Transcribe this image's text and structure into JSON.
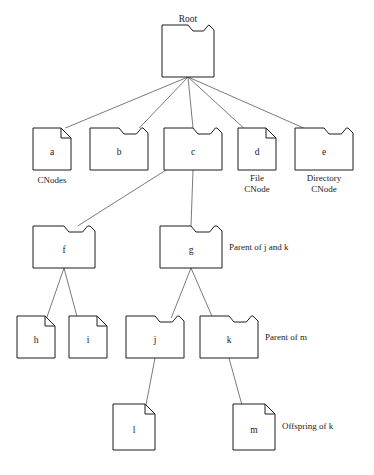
{
  "diagram": {
    "partial_top_text": "",
    "background_color": "#ffffff",
    "node_stroke_color": "#1c1c1c",
    "edge_stroke_color": "#6b6b6b",
    "text_color": "#1a1a1a"
  },
  "root": {
    "label": "Root",
    "type": "directory"
  },
  "nodes": [
    {
      "id": "root",
      "label": "Root",
      "type": "directory",
      "x": 162,
      "y": 25,
      "w": 52,
      "h": 52
    },
    {
      "id": "a",
      "label": "a",
      "type": "file",
      "x": 33,
      "y": 128,
      "w": 38,
      "h": 42
    },
    {
      "id": "b",
      "label": "b",
      "type": "directory",
      "x": 90,
      "y": 128,
      "w": 58,
      "h": 42
    },
    {
      "id": "c",
      "label": "c",
      "type": "directory",
      "x": 164,
      "y": 128,
      "w": 58,
      "h": 42
    },
    {
      "id": "d",
      "label": "d",
      "type": "file",
      "x": 238,
      "y": 128,
      "w": 38,
      "h": 42
    },
    {
      "id": "e",
      "label": "e",
      "type": "directory",
      "x": 295,
      "y": 128,
      "w": 58,
      "h": 42
    },
    {
      "id": "f",
      "label": "f",
      "type": "directory",
      "x": 33,
      "y": 226,
      "w": 62,
      "h": 42
    },
    {
      "id": "g",
      "label": "g",
      "type": "directory",
      "x": 160,
      "y": 226,
      "w": 62,
      "h": 42
    },
    {
      "id": "h",
      "label": "h",
      "type": "file",
      "x": 17,
      "y": 316,
      "w": 38,
      "h": 42
    },
    {
      "id": "i",
      "label": "i",
      "type": "file",
      "x": 69,
      "y": 316,
      "w": 38,
      "h": 42
    },
    {
      "id": "j",
      "label": "j",
      "type": "directory",
      "x": 126,
      "y": 316,
      "w": 58,
      "h": 42
    },
    {
      "id": "k",
      "label": "k",
      "type": "directory",
      "x": 200,
      "y": 316,
      "w": 58,
      "h": 42
    },
    {
      "id": "l",
      "label": "l",
      "type": "file",
      "x": 113,
      "y": 404,
      "w": 42,
      "h": 46
    },
    {
      "id": "m",
      "label": "m",
      "type": "file",
      "x": 233,
      "y": 404,
      "w": 42,
      "h": 46
    }
  ],
  "edges": [
    {
      "from": "root",
      "to": "a"
    },
    {
      "from": "root",
      "to": "b"
    },
    {
      "from": "root",
      "to": "c"
    },
    {
      "from": "root",
      "to": "d"
    },
    {
      "from": "root",
      "to": "e"
    },
    {
      "from": "c",
      "to": "f"
    },
    {
      "from": "c",
      "to": "g"
    },
    {
      "from": "f",
      "to": "h"
    },
    {
      "from": "f",
      "to": "i"
    },
    {
      "from": "g",
      "to": "j"
    },
    {
      "from": "g",
      "to": "k"
    },
    {
      "from": "j",
      "to": "l"
    },
    {
      "from": "k",
      "to": "m"
    }
  ],
  "captions": [
    {
      "id": "cnodes",
      "text": "CNodes",
      "x": 52,
      "y": 183,
      "align": "center"
    },
    {
      "id": "file-cnode-1",
      "text": "File",
      "x": 257,
      "y": 181,
      "align": "center"
    },
    {
      "id": "file-cnode-2",
      "text": "CNode",
      "x": 257,
      "y": 192,
      "align": "center"
    },
    {
      "id": "dir-cnode-1",
      "text": "Directory",
      "x": 324,
      "y": 181,
      "align": "center"
    },
    {
      "id": "dir-cnode-2",
      "text": "CNode",
      "x": 324,
      "y": 192,
      "align": "center"
    },
    {
      "id": "parent-j-k",
      "text": "Parent of j and k",
      "x": 229,
      "y": 250,
      "align": "left"
    },
    {
      "id": "parent-m",
      "text": "Parent of m",
      "x": 265,
      "y": 340,
      "align": "left"
    },
    {
      "id": "offspring-k",
      "text": "Offspring of k",
      "x": 282,
      "y": 429,
      "align": "left"
    }
  ]
}
